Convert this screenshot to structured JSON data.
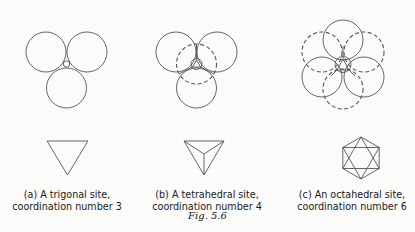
{
  "figure": {
    "label": "Fig. 5.6",
    "panels": [
      {
        "id": "a",
        "caption_line1": "(a) A trigonal site,",
        "caption_line2": "coordination number 3",
        "site_type": "trigonal",
        "coordination_number": 3
      },
      {
        "id": "b",
        "caption_line1": "(b) A tetrahedral site,",
        "caption_line2": "coordination number 4",
        "site_type": "tetrahedral",
        "coordination_number": 4
      },
      {
        "id": "c",
        "caption_line1": "(c) An octahedral site,",
        "caption_line2": "coordination number 6",
        "site_type": "octahedral",
        "coordination_number": 6
      }
    ]
  },
  "colors": {
    "line": "#555555",
    "text": "#1a1a1a",
    "background": "#fbfbf9"
  }
}
